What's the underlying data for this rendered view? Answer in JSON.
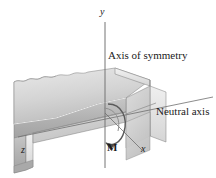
{
  "figure": {
    "type": "engineering-mechanics-diagram",
    "background_color": "#ffffff"
  },
  "labels": {
    "axis_of_symmetry": "Axis of symmetry",
    "neutral_axis": "Neutral axis",
    "moment": "M",
    "axis_y": "y",
    "axis_x": "x",
    "axis_z": "z"
  },
  "colors": {
    "top_face": "#d6d6d6",
    "front_face": "#b4b4b4",
    "side_face": "#9a9a9a",
    "inner_face": "#c9c9c9",
    "edge_line": "#6e6e6e",
    "axis_line": "#777777",
    "text": "#1a1a1a"
  },
  "geometry": {
    "origin": [
      105,
      113
    ],
    "y_axis_top": [
      105,
      22
    ],
    "y_axis_bottom": [
      105,
      168
    ],
    "x_axis_end": [
      143,
      151
    ],
    "z_axis_end": [
      30,
      150
    ],
    "neutral_axis_left": [
      18,
      137
    ],
    "neutral_axis_right": [
      210,
      98
    ]
  },
  "annotations": {
    "moment_arrow": "curved-arrow-about-z-axis",
    "broken_end": "torn-section-left-end"
  }
}
